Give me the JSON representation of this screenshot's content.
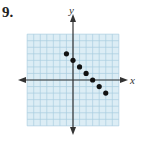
{
  "problem": {
    "number": "9."
  },
  "colors": {
    "grid_bg": "#dcedf5",
    "grid_line": "#a9cde0",
    "axis": "#333333",
    "point": "#111111"
  },
  "chart_data": {
    "type": "scatter",
    "title": "",
    "xlabel": "x",
    "ylabel": "y",
    "grid": true,
    "xlim": [
      -7,
      7
    ],
    "ylim": [
      -7,
      7
    ],
    "points": [
      {
        "x": -1,
        "y": 4
      },
      {
        "x": 0,
        "y": 3
      },
      {
        "x": 1,
        "y": 2
      },
      {
        "x": 2,
        "y": 1
      },
      {
        "x": 3,
        "y": 0
      },
      {
        "x": 4,
        "y": -1
      },
      {
        "x": 5,
        "y": -2
      }
    ]
  }
}
